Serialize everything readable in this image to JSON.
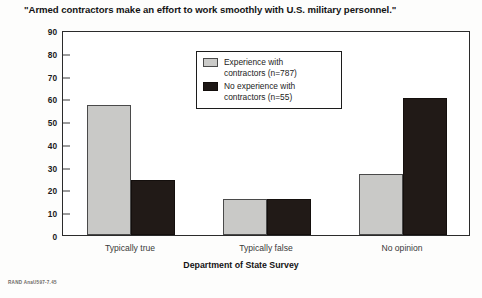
{
  "figure": {
    "title": "\"Armed contractors make an effort to work smoothly with U.S. military personnel.\"",
    "credit": "RAND AnaU597-7.45"
  },
  "legend": {
    "items": [
      {
        "swatch": "gray-swatch",
        "line1": "Experience with",
        "line2": "contractors (n=787)"
      },
      {
        "swatch": "black-swatch",
        "line1": "No experience with",
        "line2": "contractors (n=55)"
      }
    ]
  },
  "chart_data": {
    "type": "bar",
    "title": "\"Armed contractors make an effort to work smoothly with U.S. military personnel.\"",
    "xlabel": "Department of State Survey",
    "ylabel": "",
    "ylim": [
      0,
      90
    ],
    "yticks": [
      0,
      10,
      20,
      30,
      40,
      50,
      60,
      70,
      80,
      90
    ],
    "ytick_labels": [
      "0",
      "10",
      "20",
      "30",
      "40",
      "50",
      "60",
      "70",
      "80",
      "90"
    ],
    "grid": false,
    "legend_position": "upper-center-inside",
    "categories": [
      "Typically true",
      "Typically false",
      "No opinion"
    ],
    "series": [
      {
        "name": "Experience with contractors (n=787)",
        "color": "#c9c9c7",
        "values": [
          57,
          16,
          27
        ]
      },
      {
        "name": "No experience with contractors (n=55)",
        "color": "#211a17",
        "values": [
          24,
          16,
          60
        ]
      }
    ]
  }
}
